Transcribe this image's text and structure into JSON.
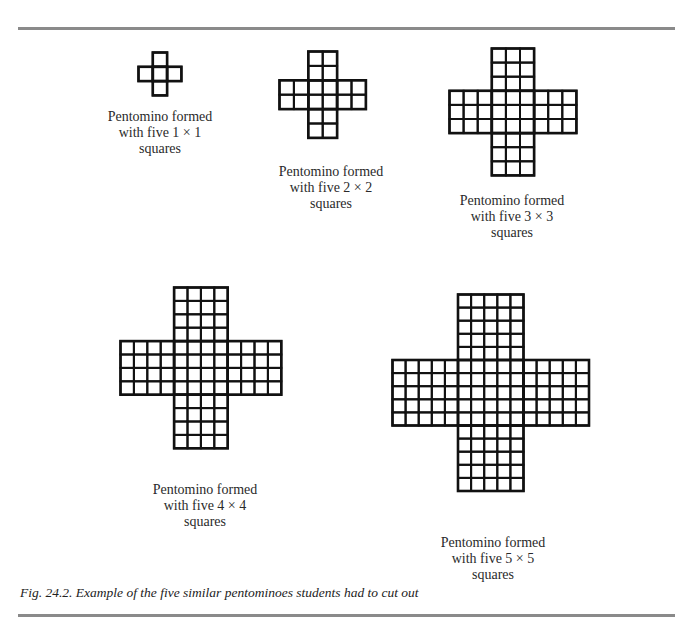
{
  "figure": {
    "caption": "Fig. 24.2. Example of the five similar pentominoes students had to cut out",
    "line_color": "#111111",
    "rule_color": "#8a8a8a"
  },
  "pentominoes": [
    {
      "id": "p1",
      "n": 1,
      "cell": 14.3,
      "x": 138,
      "y": 52,
      "caption": [
        "Pentomino formed",
        "with five 1 × 1",
        "squares"
      ],
      "cap_cx": 160,
      "cap_top": 109
    },
    {
      "id": "p2",
      "n": 2,
      "cell": 14.4,
      "x": 279,
      "y": 51,
      "caption": [
        "Pentomino formed",
        "with five 2 × 2",
        "squares"
      ],
      "cap_cx": 331,
      "cap_top": 164
    },
    {
      "id": "p3",
      "n": 3,
      "cell": 14.1,
      "x": 449,
      "y": 48,
      "caption": [
        "Pentomino formed",
        "with five 3 × 3",
        "squares"
      ],
      "cap_cx": 512,
      "cap_top": 193
    },
    {
      "id": "p4",
      "n": 4,
      "cell": 13.4,
      "x": 120,
      "y": 287,
      "caption": [
        "Pentomino formed",
        "with five 4 × 4",
        "squares"
      ],
      "cap_cx": 205,
      "cap_top": 482
    },
    {
      "id": "p5",
      "n": 5,
      "cell": 13.1,
      "x": 392,
      "y": 294,
      "caption": [
        "Pentomino formed",
        "with five 5 × 5",
        "squares"
      ],
      "cap_cx": 493,
      "cap_top": 535
    }
  ]
}
